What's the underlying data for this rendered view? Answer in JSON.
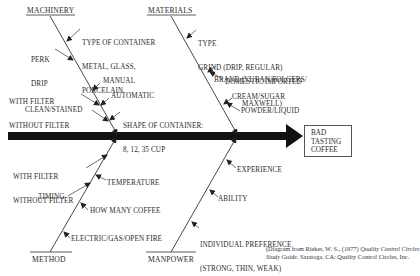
{
  "diagram": {
    "type": "fishbone",
    "effect": {
      "lines": [
        "BAD",
        "TASTING",
        "COFFEE"
      ]
    },
    "categories": {
      "machinery": {
        "label": "MACHINERY",
        "causes": [
          {
            "lines": [
              "TYPE OF CONTAINER",
              "METAL, GLASS,",
              "PORCELAIN"
            ]
          },
          {
            "lines": [
              "PERK",
              "DRIP"
            ]
          },
          {
            "lines": [
              "MANUAL"
            ]
          },
          {
            "lines": [
              "WITH FILTER",
              "WITHOUT FILTER"
            ]
          },
          {
            "lines": [
              "AUTOMATIC"
            ]
          },
          {
            "lines": [
              "CLEAN/STAINED"
            ]
          },
          {
            "lines": [
              "SHAPE OF CONTAINER:",
              "8, 12, 35 CUP"
            ]
          }
        ]
      },
      "materials": {
        "label": "MATERIALS",
        "causes": [
          {
            "lines": [
              "TYPE",
              "GRIND (DRIP, REGULAR)"
            ]
          },
          {
            "lines": [
              "BRAND (YUBAN/FOLGERS/",
              "MAXWELL)"
            ]
          },
          {
            "lines": [
              "DOMESTIC/IMPORTED"
            ]
          },
          {
            "lines": [
              "CREAM/SUGAR"
            ]
          },
          {
            "lines": [
              "POWDER/LIQUID"
            ]
          }
        ]
      },
      "method": {
        "label": "METHOD",
        "causes": [
          {
            "lines": [
              "WITH FILTER",
              "WITHOUT FILTER"
            ]
          },
          {
            "lines": [
              "TEMPERATURE"
            ]
          },
          {
            "lines": [
              "TIMING"
            ]
          },
          {
            "lines": [
              "HOW MANY COFFEE"
            ]
          },
          {
            "lines": [
              "ELECTRIC/GAS/OPEN FIRE"
            ]
          }
        ]
      },
      "manpower": {
        "label": "MANPOWER",
        "causes": [
          {
            "lines": [
              "EXPERIENCE"
            ]
          },
          {
            "lines": [
              "ABILITY"
            ]
          },
          {
            "lines": [
              "INDIVIDUAL PREFERENCE",
              "(STRONG, THIN, WEAK)"
            ]
          }
        ]
      }
    },
    "credit": {
      "prefix": "(Diagram from Rieker, W. S., (1977) ",
      "title_part1": "Quality Control Circles",
      "title_part2": "Study Guide.",
      "suffix": " Saratoga, CA: Quality Control Circles, Inc."
    }
  }
}
